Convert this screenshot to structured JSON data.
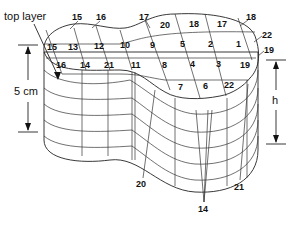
{
  "diagram": {
    "labels": {
      "top_layer": "top layer",
      "thickness": "5 cm",
      "height": "h"
    },
    "top_layer_cells": [
      {
        "row": 0,
        "values": [
          "20",
          "18",
          "17"
        ]
      },
      {
        "row": 1,
        "values": [
          "15",
          "13",
          "12",
          "10",
          "9",
          "5",
          "2",
          "1"
        ]
      },
      {
        "row": 2,
        "values": [
          "16",
          "14",
          "21",
          "11",
          "8",
          "4",
          "3",
          "19"
        ]
      },
      {
        "row": 3,
        "values": [
          "7",
          "6",
          "22"
        ]
      }
    ],
    "callouts": {
      "top_left_1": "15",
      "top_left_2": "16",
      "top_mid": "17",
      "right_1": "18",
      "right_2": "22",
      "right_3": "19",
      "bottom_1": "20",
      "bottom_2": "14",
      "bottom_3": "21"
    },
    "colors": {
      "top_fill": "#d4d4d4",
      "side_fill": "#ffffff",
      "line": "#222222"
    }
  }
}
